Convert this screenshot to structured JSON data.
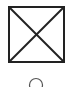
{
  "placeholder": {
    "icon": "image-placeholder-icon",
    "stroke_color": "#222222",
    "background": "#ffffff"
  },
  "control": {
    "icon": "radio-circle-icon",
    "stroke_color": "#555555",
    "checked": false
  }
}
